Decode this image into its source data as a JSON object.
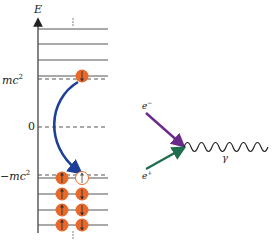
{
  "energy_diagram": {
    "axis_label": "E",
    "level_labels": {
      "positive": "mc",
      "positive_sup": "2",
      "zero": "0",
      "negative": "−mc",
      "negative_sup": "2"
    },
    "continuation_marks": ":",
    "upper_continuum_levels": 4,
    "lower_continuum_levels": 4,
    "excited_electron_spin": "down",
    "hole_spin": "up",
    "filled_states": [
      {
        "left": "up",
        "right": "hole"
      },
      {
        "left": "up",
        "right": "down"
      },
      {
        "left": "up",
        "right": "down"
      },
      {
        "left": "up",
        "right": "down"
      }
    ]
  },
  "feynman_diagram": {
    "electron_label": "e",
    "electron_sup": "−",
    "positron_label": "e",
    "positron_sup": "+",
    "photon_label": "γ"
  },
  "colors": {
    "electron_fill": "#e8692a",
    "transition_arrow": "#1d3f9a",
    "electron_line": "#6a2a8a",
    "positron_line": "#1f6e4e",
    "level_line": "#555555",
    "axis": "#333333"
  }
}
